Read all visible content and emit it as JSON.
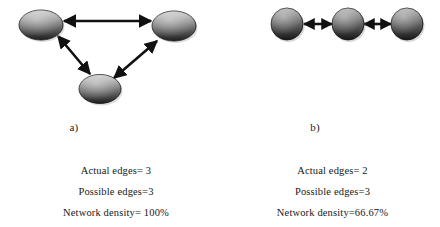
{
  "figure": {
    "background_color": "#ffffff",
    "node_color_top": "#b9b9b9",
    "node_color_bottom": "#232323",
    "edge_color": "#111111"
  },
  "panels": [
    {
      "id": "a",
      "caption": "a)",
      "graph": {
        "node_shape": "ellipse",
        "nodes": [
          {
            "name": "node-top-left",
            "cx": 41,
            "cy": 25,
            "rx": 22,
            "ry": 15
          },
          {
            "name": "node-top-right",
            "cx": 174,
            "cy": 26,
            "rx": 22,
            "ry": 15
          },
          {
            "name": "node-bottom",
            "cx": 100,
            "cy": 89,
            "rx": 21,
            "ry": 14.5
          }
        ],
        "edges": [
          {
            "name": "edge-topleft-topright",
            "x1": 64,
            "y1": 21,
            "x2": 151,
            "y2": 21,
            "arrows": "both"
          },
          {
            "name": "edge-topleft-bottom",
            "x1": 58,
            "y1": 36,
            "x2": 90,
            "y2": 74,
            "arrows": "both"
          },
          {
            "name": "edge-bottom-topright",
            "x1": 114,
            "y1": 78,
            "x2": 157,
            "y2": 41,
            "arrows": "both"
          }
        ]
      },
      "stats": [
        "Actual edges= 3",
        "Possible edges=3",
        "Network density= 100%"
      ]
    },
    {
      "id": "b",
      "caption": "b)",
      "graph": {
        "node_shape": "circle",
        "nodes": [
          {
            "name": "node-left",
            "cx": 62,
            "cy": 24,
            "rx": 16,
            "ry": 16
          },
          {
            "name": "node-middle",
            "cx": 123,
            "cy": 24,
            "rx": 16,
            "ry": 16
          },
          {
            "name": "node-right",
            "cx": 182,
            "cy": 24,
            "rx": 16,
            "ry": 16
          }
        ],
        "edges": [
          {
            "name": "edge-left-middle",
            "x1": 79,
            "y1": 24,
            "x2": 107,
            "y2": 24,
            "arrows": "both"
          },
          {
            "name": "edge-middle-right",
            "x1": 139,
            "y1": 24,
            "x2": 166,
            "y2": 24,
            "arrows": "both"
          }
        ]
      },
      "stats": [
        "Actual edges= 2",
        "Possible edges=3",
        "Network density=66.67%"
      ]
    }
  ]
}
